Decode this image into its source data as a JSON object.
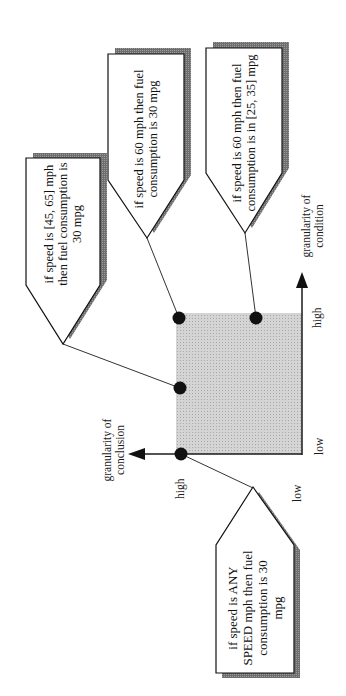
{
  "diagram": {
    "orientation": "rotated-90-ccw",
    "colors": {
      "square_fill": "#c9c9c9",
      "shadow": "#7a7a7a",
      "line": "#1a1a1a",
      "dot": "#111111"
    },
    "axes": {
      "condition": {
        "label": "granularity of condition",
        "label_line1": "granularity of",
        "label_line2": "condition",
        "high": "high",
        "low": "low"
      },
      "conclusion": {
        "label": "granularity of conclusion",
        "label_line1": "granularity of",
        "label_line2": "conclusion",
        "high": "high",
        "low": "low"
      }
    },
    "rules": [
      {
        "id": "rule-interval-speed",
        "text": "if speed is [45, 65] mph then fuel consumption is 30 mpg",
        "condition_granularity": "medium",
        "conclusion_granularity": "high"
      },
      {
        "id": "rule-precise",
        "text": "if speed is 60 mph then fuel consumption is 30 mpg",
        "condition_granularity": "high",
        "conclusion_granularity": "high"
      },
      {
        "id": "rule-interval-consumption",
        "text": "if speed is 60 mph then fuel consumption is in [25, 35] mpg",
        "condition_granularity": "high",
        "conclusion_granularity": "low"
      },
      {
        "id": "rule-any-speed",
        "text": "if speed is ANY SPEED mph then fuel consumption is 30 mpg",
        "condition_granularity": "low",
        "conclusion_granularity": "high"
      }
    ]
  }
}
